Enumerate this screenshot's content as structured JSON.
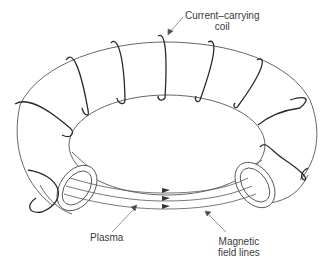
{
  "diagram": {
    "type": "toroidal magnetic confinement (tokamak) schematic",
    "labels": {
      "coil": {
        "line1": "Current–carrying",
        "line2": "coil"
      },
      "plasma": "Plasma",
      "field_lines": {
        "line1": "Magnetic",
        "line2": "field lines"
      }
    },
    "elements": {
      "torus": "torus-body",
      "coil_turns": 11,
      "field_line_count": 3,
      "cross_sections": 2
    },
    "colors": {
      "outline": "#555555",
      "coil": "#2a2a2a",
      "text": "#3a3a3a",
      "background": "#ffffff"
    }
  }
}
